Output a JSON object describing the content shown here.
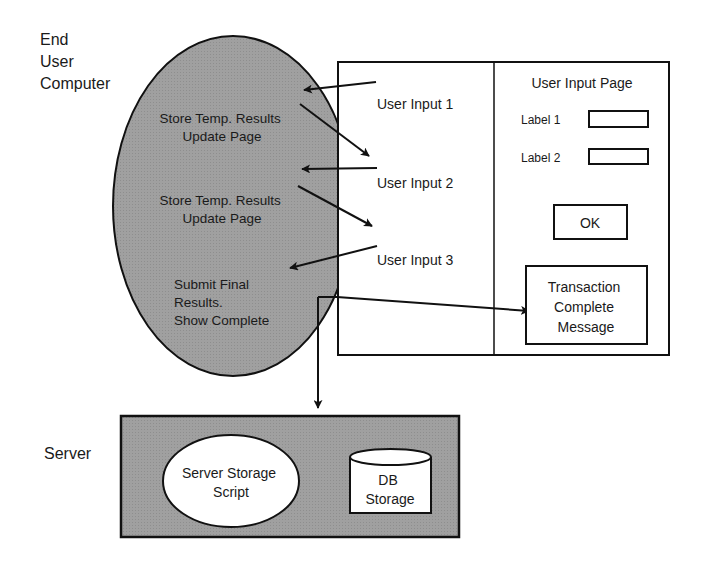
{
  "colors": {
    "stroke": "#111111",
    "shaded_fill": "#9c9c9c",
    "background": "#ffffff",
    "text": "#1a1a1a"
  },
  "client": {
    "label_lines": [
      "End",
      "User",
      "Computer"
    ],
    "ellipse_steps": [
      {
        "lines": [
          "Store Temp. Results",
          "Update Page"
        ]
      },
      {
        "lines": [
          "Store Temp. Results",
          "Update Page"
        ]
      },
      {
        "lines": [
          "Submit Final",
          "Results.",
          "Show Complete"
        ]
      }
    ]
  },
  "browser_window": {
    "inputs_column": [
      "User Input 1",
      "User Input 2",
      "User Input 3"
    ],
    "page": {
      "title": "User Input Page",
      "fields": [
        {
          "label": "Label 1",
          "value": ""
        },
        {
          "label": "Label 2",
          "value": ""
        }
      ],
      "ok_button": "OK",
      "result_box_lines": [
        "Transaction",
        "Complete",
        "Message"
      ]
    }
  },
  "server": {
    "label": "Server",
    "script_lines": [
      "Server Storage",
      "Script"
    ],
    "db_lines": [
      "DB",
      "Storage"
    ]
  }
}
